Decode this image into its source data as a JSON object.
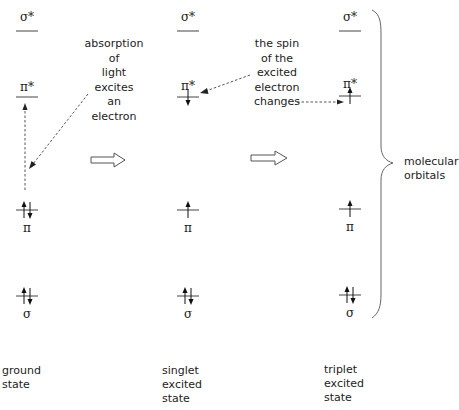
{
  "diagram": {
    "columns": [
      {
        "id": "ground",
        "label_lines": [
          "ground",
          "state"
        ],
        "levels": {
          "sigma_star": {
            "label": "σ*",
            "electrons": []
          },
          "pi_star": {
            "label": "π*",
            "electrons": []
          },
          "pi": {
            "label": "π",
            "electrons": [
              "up",
              "down"
            ]
          },
          "sigma": {
            "label": "σ",
            "electrons": [
              "up",
              "down"
            ]
          }
        }
      },
      {
        "id": "singlet",
        "label_lines": [
          "singlet",
          "excited",
          "state"
        ],
        "levels": {
          "sigma_star": {
            "label": "σ*",
            "electrons": []
          },
          "pi_star": {
            "label": "π*",
            "electrons": [
              "down"
            ]
          },
          "pi": {
            "label": "π",
            "electrons": [
              "up"
            ]
          },
          "sigma": {
            "label": "σ",
            "electrons": [
              "up",
              "down"
            ]
          }
        }
      },
      {
        "id": "triplet",
        "label_lines": [
          "triplet",
          "excited",
          "state"
        ],
        "levels": {
          "sigma_star": {
            "label": "σ*",
            "electrons": []
          },
          "pi_star": {
            "label": "π*",
            "electrons": [
              "up"
            ]
          },
          "pi": {
            "label": "π",
            "electrons": [
              "up"
            ]
          },
          "sigma": {
            "label": "σ",
            "electrons": [
              "up",
              "down"
            ]
          }
        }
      }
    ],
    "annotations": {
      "absorption": [
        "absorption",
        "of",
        "light",
        "excites",
        "an",
        "electron"
      ],
      "spin_change": [
        "the spin",
        "of the",
        "excited",
        "electron",
        "changes"
      ]
    },
    "brace_label": [
      "molecular",
      "orbitals"
    ],
    "colors": {
      "ink": "#222222",
      "level_line": "#444444",
      "dashed": "#555555",
      "brace": "#666666"
    }
  }
}
